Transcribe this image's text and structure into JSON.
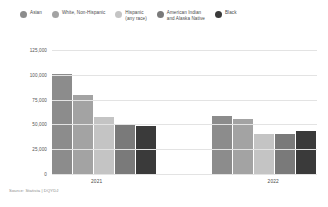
{
  "chart_data": {
    "type": "bar",
    "title": "",
    "xlabel": "",
    "ylabel": "",
    "categories": [
      "2021",
      "2022"
    ],
    "ylim": [
      0,
      125000
    ],
    "yticks": [
      0,
      25000,
      50000,
      75000,
      100000,
      125000
    ],
    "ytick_labels": [
      "0",
      "25,000",
      "50,000",
      "75,000",
      "100,000",
      "125,000"
    ],
    "grid": true,
    "legend_position": "top",
    "series": [
      {
        "name": "Asian",
        "color": "#8c8c8c",
        "values": [
          101000,
          58000
        ]
      },
      {
        "name": "White, Non-Hispanic",
        "color": "#a3a3a3",
        "values": [
          80000,
          55000
        ]
      },
      {
        "name": "Hispanic (any race)",
        "color": "#c4c4c4",
        "values": [
          57000,
          40000
        ]
      },
      {
        "name": "American Indian and Alaska Native",
        "color": "#7a7a7a",
        "values": [
          50000,
          40000
        ]
      },
      {
        "name": "Black",
        "color": "#3a3a3a",
        "values": [
          48000,
          43000
        ]
      }
    ]
  },
  "legend": {
    "items": [
      {
        "label": "Asian",
        "color": "#8c8c8c"
      },
      {
        "label": "White, Non-Hispanic",
        "color": "#a3a3a3"
      },
      {
        "label": "Hispanic\n(any race)",
        "color": "#c4c4c4"
      },
      {
        "label": "American Indian\nand Alaska Native",
        "color": "#7a7a7a"
      },
      {
        "label": "Black",
        "color": "#3a3a3a"
      }
    ]
  },
  "axis": {
    "ytick_labels": [
      "125,000",
      "100,000",
      "75,000",
      "50,000",
      "25,000",
      "0"
    ],
    "xtick_labels": [
      "2021",
      "2022"
    ]
  },
  "footer": {
    "source": "Source: Statista | DQYDJ"
  }
}
